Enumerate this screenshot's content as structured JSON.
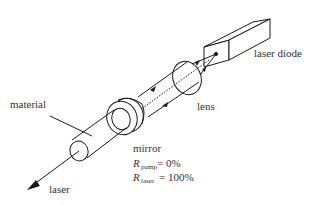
{
  "diagram": {
    "type": "end-pumped laser schematic",
    "labels": {
      "laser_diode": "laser diode",
      "lens": "lens",
      "material": "material",
      "mirror": "mirror",
      "laser_output": "laser",
      "r_symbol": "R",
      "r_pump_sub": "pump",
      "r_pump_value": "= 0%",
      "r_laser_sub": "laser",
      "r_laser_value": "= 100%"
    },
    "colors": {
      "line": "#1a1a1a",
      "text": "#333333",
      "background": "#ffffff"
    }
  }
}
